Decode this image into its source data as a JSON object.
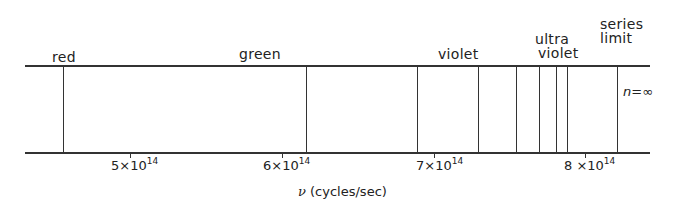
{
  "diagram": {
    "title": "",
    "region_labels": {
      "red": "red",
      "green": "green",
      "violet": "violet",
      "ultraviolet_1": "ultra",
      "ultraviolet_2": "violet",
      "series_limit_1": "series",
      "series_limit_2": "limit"
    },
    "n_infinity_label": "n=∞",
    "axis": {
      "symbol": "ν",
      "label": "(cycles/sec)",
      "ticks": [
        {
          "label": "5×10",
          "exp": "14",
          "value": 500000000000000.0
        },
        {
          "label": "6×10",
          "exp": "14",
          "value": 600000000000000.0
        },
        {
          "label": "7×10",
          "exp": "14",
          "value": 700000000000000.0
        },
        {
          "label": "8 ×10",
          "exp": "14",
          "value": 800000000000000.0
        }
      ]
    },
    "spectral_lines_x_px": [
      63,
      306,
      417,
      478,
      516,
      539,
      556,
      567,
      617
    ],
    "line_color": "#333333"
  }
}
